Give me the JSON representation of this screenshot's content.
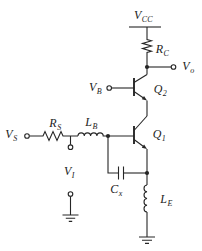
{
  "figure": {
    "kind": "circuit-schematic",
    "background_color": "#ffffff",
    "line_color": "#262626",
    "labels": {
      "vcc": {
        "main": "V",
        "sub": "CC"
      },
      "rc": {
        "main": "R",
        "sub": "C"
      },
      "vo": {
        "main": "V",
        "sub": "o"
      },
      "vb": {
        "main": "V",
        "sub": "B"
      },
      "q2": {
        "main": "Q",
        "sub": "2"
      },
      "q1": {
        "main": "Q",
        "sub": "1"
      },
      "vs": {
        "main": "V",
        "sub": "S"
      },
      "rs": {
        "main": "R",
        "sub": "S"
      },
      "lb": {
        "main": "L",
        "sub": "B"
      },
      "vi": {
        "main": "V",
        "sub": "I"
      },
      "cx": {
        "main": "C",
        "sub": "x"
      },
      "le": {
        "main": "L",
        "sub": "E"
      }
    },
    "components": [
      {
        "id": "vcc-supply",
        "type": "supply-rail",
        "label": "V_CC"
      },
      {
        "id": "rc-resistor",
        "type": "resistor",
        "label": "R_C"
      },
      {
        "id": "vo-terminal",
        "type": "open-terminal",
        "label": "V_o"
      },
      {
        "id": "q2-transistor",
        "type": "npn-bjt",
        "label": "Q_2"
      },
      {
        "id": "vb-terminal",
        "type": "open-terminal",
        "label": "V_B"
      },
      {
        "id": "q1-transistor",
        "type": "npn-bjt",
        "label": "Q_1"
      },
      {
        "id": "vs-terminal",
        "type": "open-terminal",
        "label": "V_S"
      },
      {
        "id": "rs-resistor",
        "type": "resistor",
        "label": "R_S"
      },
      {
        "id": "lb-inductor",
        "type": "inductor",
        "label": "L_B"
      },
      {
        "id": "vi-terminal",
        "type": "terminal-pair",
        "label": "V_I"
      },
      {
        "id": "cx-capacitor",
        "type": "capacitor",
        "label": "C_x"
      },
      {
        "id": "le-inductor",
        "type": "inductor",
        "label": "L_E"
      },
      {
        "id": "ground-left",
        "type": "earth-ground",
        "label": ""
      },
      {
        "id": "ground-right",
        "type": "earth-ground",
        "label": ""
      }
    ]
  }
}
